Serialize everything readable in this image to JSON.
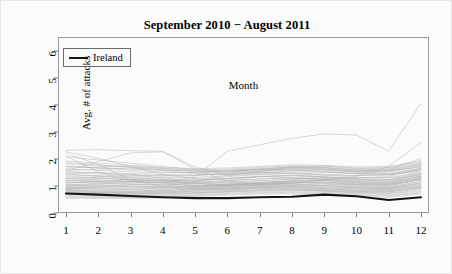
{
  "chart_data": {
    "type": "line",
    "title": "September 2010 − August 2011",
    "xlabel": "Month",
    "ylabel": "Avg. # of attacks",
    "xlim": [
      1,
      12
    ],
    "ylim": [
      0,
      6.5
    ],
    "grid": false,
    "legend": {
      "position": "top-left-inside",
      "entries": [
        {
          "name": "Ireland",
          "color": "#151515",
          "width": 2.1
        }
      ]
    },
    "x": [
      1,
      2,
      3,
      4,
      5,
      6,
      7,
      8,
      9,
      10,
      11,
      12
    ],
    "x_ticks": [
      "1",
      "2",
      "3",
      "4",
      "5",
      "6",
      "7",
      "8",
      "9",
      "10",
      "11",
      "12"
    ],
    "y_ticks": [
      "0",
      "1",
      "2",
      "3",
      "4",
      "5",
      "6"
    ],
    "highlight_series": {
      "name": "Ireland",
      "color": "#151515",
      "width": 2.1,
      "values": [
        0.72,
        0.68,
        0.63,
        0.58,
        0.55,
        0.55,
        0.58,
        0.6,
        0.68,
        0.62,
        0.48,
        0.58
      ]
    },
    "background_series_color": "#b0b0b0",
    "background_series_width": 0.55,
    "series": [
      {
        "name": "bg-01",
        "values": [
          2.32,
          2.34,
          2.3,
          2.28,
          1.7,
          1.4,
          1.52,
          1.7,
          1.62,
          1.55,
          1.6,
          2.02
        ]
      },
      {
        "name": "bg-02",
        "values": [
          2.26,
          2.02,
          1.72,
          1.42,
          1.28,
          1.2,
          1.35,
          1.3,
          1.28,
          1.3,
          1.35,
          1.62
        ]
      },
      {
        "name": "bg-03",
        "values": [
          2.2,
          1.8,
          1.22,
          0.98,
          1.15,
          1.4,
          1.5,
          1.46,
          1.4,
          1.38,
          1.42,
          1.55
        ]
      },
      {
        "name": "bg-04",
        "values": [
          2.1,
          1.52,
          1.18,
          1.12,
          1.32,
          2.28,
          2.52,
          2.76,
          2.92,
          2.88,
          2.28,
          4.05
        ]
      },
      {
        "name": "bg-05",
        "values": [
          1.55,
          1.9,
          2.22,
          2.26,
          1.62,
          1.18,
          1.05,
          1.1,
          1.22,
          1.35,
          1.72,
          2.6
        ]
      },
      {
        "name": "bg-06",
        "values": [
          1.48,
          1.5,
          1.46,
          1.42,
          1.4,
          1.44,
          1.48,
          1.52,
          1.5,
          1.46,
          1.52,
          1.72
        ]
      },
      {
        "name": "bg-07",
        "values": [
          1.72,
          1.68,
          1.62,
          1.58,
          1.55,
          1.58,
          1.64,
          1.7,
          1.66,
          1.58,
          1.6,
          1.78
        ]
      },
      {
        "name": "bg-08",
        "values": [
          1.62,
          1.58,
          1.52,
          1.48,
          1.5,
          1.55,
          1.6,
          1.62,
          1.58,
          1.52,
          1.55,
          1.7
        ]
      },
      {
        "name": "bg-09",
        "values": [
          1.4,
          1.38,
          1.34,
          1.3,
          1.32,
          1.38,
          1.44,
          1.48,
          1.44,
          1.38,
          1.4,
          1.58
        ]
      },
      {
        "name": "bg-10",
        "values": [
          1.3,
          1.28,
          1.24,
          1.2,
          1.22,
          1.28,
          1.34,
          1.38,
          1.34,
          1.28,
          1.3,
          1.48
        ]
      },
      {
        "name": "bg-11",
        "values": [
          1.22,
          1.18,
          1.14,
          1.12,
          1.14,
          1.2,
          1.26,
          1.3,
          1.26,
          1.2,
          1.22,
          1.4
        ]
      },
      {
        "name": "bg-12",
        "values": [
          1.14,
          1.1,
          1.06,
          1.04,
          1.08,
          1.14,
          1.2,
          1.24,
          1.2,
          1.14,
          1.16,
          1.34
        ]
      },
      {
        "name": "bg-13",
        "values": [
          1.06,
          1.04,
          1.0,
          0.98,
          1.02,
          1.08,
          1.14,
          1.18,
          1.14,
          1.08,
          1.1,
          1.28
        ]
      },
      {
        "name": "bg-14",
        "values": [
          1.0,
          0.98,
          0.95,
          0.93,
          0.97,
          1.03,
          1.08,
          1.12,
          1.08,
          1.02,
          1.04,
          1.22
        ]
      },
      {
        "name": "bg-15",
        "values": [
          0.95,
          0.93,
          0.9,
          0.88,
          0.92,
          0.98,
          1.03,
          1.06,
          1.02,
          0.96,
          0.98,
          1.16
        ]
      },
      {
        "name": "bg-16",
        "values": [
          0.9,
          0.88,
          0.86,
          0.84,
          0.88,
          0.93,
          0.98,
          1.01,
          0.97,
          0.92,
          0.94,
          1.1
        ]
      },
      {
        "name": "bg-17",
        "values": [
          0.86,
          0.84,
          0.82,
          0.8,
          0.84,
          0.89,
          0.94,
          0.96,
          0.93,
          0.88,
          0.9,
          1.05
        ]
      },
      {
        "name": "bg-18",
        "values": [
          0.82,
          0.8,
          0.78,
          0.77,
          0.8,
          0.85,
          0.9,
          0.92,
          0.89,
          0.84,
          0.86,
          1.0
        ]
      },
      {
        "name": "bg-19",
        "values": [
          0.78,
          0.76,
          0.75,
          0.74,
          0.77,
          0.82,
          0.86,
          0.88,
          0.85,
          0.8,
          0.82,
          0.96
        ]
      },
      {
        "name": "bg-20",
        "values": [
          0.75,
          0.73,
          0.72,
          0.71,
          0.74,
          0.78,
          0.82,
          0.85,
          0.82,
          0.77,
          0.78,
          0.92
        ]
      },
      {
        "name": "bg-21",
        "values": [
          1.82,
          1.76,
          1.7,
          1.64,
          1.6,
          1.62,
          1.68,
          1.74,
          1.72,
          1.64,
          1.66,
          1.86
        ]
      },
      {
        "name": "bg-22",
        "values": [
          1.92,
          1.84,
          1.76,
          1.68,
          1.64,
          1.66,
          1.72,
          1.78,
          1.76,
          1.7,
          1.72,
          1.9
        ]
      },
      {
        "name": "bg-23",
        "values": [
          1.26,
          1.34,
          1.4,
          1.3,
          1.18,
          1.12,
          1.18,
          1.26,
          1.3,
          1.22,
          1.18,
          1.42
        ]
      },
      {
        "name": "bg-24",
        "values": [
          1.18,
          1.26,
          1.32,
          1.24,
          1.12,
          1.06,
          1.12,
          1.2,
          1.24,
          1.16,
          1.12,
          1.36
        ]
      },
      {
        "name": "bg-25",
        "values": [
          0.98,
          1.06,
          1.14,
          1.1,
          1.0,
          0.96,
          1.02,
          1.1,
          1.14,
          1.04,
          1.0,
          1.24
        ]
      },
      {
        "name": "bg-26",
        "values": [
          0.92,
          0.99,
          1.06,
          1.03,
          0.94,
          0.9,
          0.96,
          1.03,
          1.07,
          0.98,
          0.94,
          1.17
        ]
      },
      {
        "name": "bg-27",
        "values": [
          0.88,
          0.82,
          0.8,
          0.86,
          0.94,
          1.02,
          1.06,
          1.02,
          0.94,
          0.88,
          0.86,
          1.02
        ]
      },
      {
        "name": "bg-28",
        "values": [
          0.84,
          0.78,
          0.76,
          0.82,
          0.9,
          0.98,
          1.02,
          0.98,
          0.9,
          0.84,
          0.82,
          0.98
        ]
      },
      {
        "name": "bg-29",
        "values": [
          0.8,
          0.75,
          0.73,
          0.78,
          0.86,
          0.93,
          0.97,
          0.94,
          0.86,
          0.8,
          0.78,
          0.94
        ]
      },
      {
        "name": "bg-30",
        "values": [
          0.76,
          0.71,
          0.7,
          0.74,
          0.82,
          0.89,
          0.93,
          0.9,
          0.82,
          0.76,
          0.74,
          0.9
        ]
      },
      {
        "name": "bg-31",
        "values": [
          1.44,
          1.36,
          1.28,
          1.24,
          1.26,
          1.34,
          1.42,
          1.46,
          1.4,
          1.32,
          1.3,
          1.52
        ]
      },
      {
        "name": "bg-32",
        "values": [
          1.36,
          1.3,
          1.22,
          1.18,
          1.2,
          1.28,
          1.36,
          1.4,
          1.34,
          1.26,
          1.24,
          1.46
        ]
      },
      {
        "name": "bg-33",
        "values": [
          1.1,
          1.16,
          1.22,
          1.18,
          1.08,
          1.02,
          1.08,
          1.16,
          1.2,
          1.1,
          1.06,
          1.3
        ]
      },
      {
        "name": "bg-34",
        "values": [
          1.04,
          1.1,
          1.16,
          1.12,
          1.03,
          0.98,
          1.04,
          1.11,
          1.15,
          1.05,
          1.01,
          1.25
        ]
      },
      {
        "name": "bg-35",
        "values": [
          0.7,
          0.68,
          0.67,
          0.69,
          0.74,
          0.8,
          0.85,
          0.86,
          0.8,
          0.74,
          0.72,
          0.86
        ]
      },
      {
        "name": "bg-36",
        "values": [
          0.66,
          0.65,
          0.64,
          0.66,
          0.71,
          0.77,
          0.81,
          0.82,
          0.77,
          0.71,
          0.69,
          0.82
        ]
      },
      {
        "name": "bg-37",
        "values": [
          1.58,
          1.62,
          1.66,
          1.58,
          1.46,
          1.42,
          1.48,
          1.56,
          1.6,
          1.5,
          1.46,
          1.66
        ]
      },
      {
        "name": "bg-38",
        "values": [
          1.66,
          1.7,
          1.74,
          1.66,
          1.54,
          1.5,
          1.56,
          1.64,
          1.68,
          1.58,
          1.54,
          1.74
        ]
      },
      {
        "name": "bg-39",
        "values": [
          0.94,
          0.9,
          0.88,
          0.92,
          0.99,
          1.06,
          1.1,
          1.08,
          1.0,
          0.94,
          0.92,
          1.08
        ]
      },
      {
        "name": "bg-40",
        "values": [
          1.48,
          1.44,
          1.4,
          1.36,
          1.38,
          1.46,
          1.54,
          1.58,
          1.52,
          1.44,
          1.42,
          1.62
        ]
      },
      {
        "name": "bg-41",
        "values": [
          1.74,
          1.66,
          1.58,
          1.52,
          1.48,
          1.52,
          1.6,
          1.66,
          1.62,
          1.54,
          1.56,
          1.8
        ]
      },
      {
        "name": "bg-42",
        "values": [
          0.62,
          0.61,
          0.6,
          0.62,
          0.67,
          0.73,
          0.77,
          0.78,
          0.73,
          0.67,
          0.65,
          0.78
        ]
      },
      {
        "name": "bg-43",
        "values": [
          1.2,
          1.14,
          1.08,
          1.06,
          1.1,
          1.18,
          1.26,
          1.3,
          1.24,
          1.16,
          1.14,
          1.36
        ]
      },
      {
        "name": "bg-44",
        "values": [
          1.02,
          1.0,
          0.97,
          0.95,
          0.99,
          1.05,
          1.1,
          1.14,
          1.1,
          1.04,
          1.06,
          1.24
        ]
      },
      {
        "name": "bg-45",
        "values": [
          0.88,
          0.94,
          1.0,
          0.97,
          0.89,
          0.85,
          0.91,
          0.98,
          1.02,
          0.93,
          0.89,
          1.12
        ]
      },
      {
        "name": "bg-46",
        "values": [
          1.28,
          1.22,
          1.16,
          1.14,
          1.18,
          1.26,
          1.34,
          1.38,
          1.32,
          1.24,
          1.22,
          1.44
        ]
      },
      {
        "name": "bg-47",
        "values": [
          1.12,
          1.18,
          1.24,
          1.2,
          1.1,
          1.04,
          1.1,
          1.18,
          1.22,
          1.12,
          1.08,
          1.32
        ]
      },
      {
        "name": "bg-48",
        "values": [
          0.58,
          0.57,
          0.57,
          0.59,
          0.64,
          0.7,
          0.74,
          0.75,
          0.7,
          0.64,
          0.62,
          0.74
        ]
      },
      {
        "name": "bg-49",
        "values": [
          1.54,
          1.48,
          1.42,
          1.38,
          1.4,
          1.48,
          1.56,
          1.6,
          1.54,
          1.46,
          1.44,
          1.64
        ]
      },
      {
        "name": "bg-50",
        "values": [
          2.08,
          1.96,
          1.84,
          1.72,
          1.6,
          1.56,
          1.62,
          1.7,
          1.74,
          1.66,
          1.68,
          1.94
        ]
      },
      {
        "name": "bg-51",
        "values": [
          0.54,
          0.54,
          0.54,
          0.56,
          0.61,
          0.66,
          0.7,
          0.71,
          0.66,
          0.6,
          0.58,
          0.7
        ]
      },
      {
        "name": "bg-52",
        "values": [
          1.86,
          1.78,
          1.68,
          1.6,
          1.54,
          1.56,
          1.62,
          1.7,
          1.68,
          1.6,
          1.62,
          1.84
        ]
      }
    ]
  },
  "legend": {
    "label": "Ireland"
  },
  "axes": {
    "x_title": "Month",
    "y_title": "Avg. # of attacks"
  },
  "title": "September 2010 − August 2011"
}
